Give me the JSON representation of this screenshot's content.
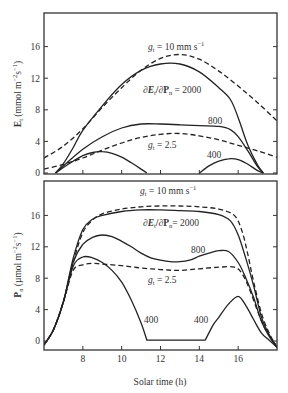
{
  "chart_data": [
    {
      "type": "line",
      "panel": "top",
      "ylabel": "E_t (mmol m⁻²s⁻¹)",
      "ylabel_main": "E",
      "ylabel_sub": "t",
      "ylabel_units": " (mmol m",
      "ylabel_exp1": "−2",
      "ylabel_mid": "s",
      "ylabel_exp2": "−1",
      "ylabel_end": ")",
      "xlim": [
        6,
        18
      ],
      "ylim": [
        0,
        20
      ],
      "yticks": [
        0,
        4,
        8,
        12,
        16
      ],
      "xticks": [
        8,
        10,
        12,
        14,
        16
      ],
      "annotations": {
        "g10": "g",
        "g10_sub": "t",
        "g10_rest": " = 10 mm s",
        "g10_exp": "−1",
        "ratio": "∂E",
        "ratio_sub1": "t",
        "ratio_mid": "/∂P",
        "ratio_sub2": "n",
        "ratio_rest": " = 2000",
        "l800": "800",
        "g25": "g",
        "g25_sub": "t",
        "g25_rest": " = 2.5",
        "l400": "400"
      },
      "series": [
        {
          "name": "g_t = 10 mm s-1",
          "style": "dashed",
          "x": [
            6.0,
            7,
            8,
            9,
            10,
            11,
            12,
            13,
            14,
            15,
            16,
            17,
            18
          ],
          "y": [
            1.9,
            3.4,
            5.6,
            8.3,
            10.8,
            13.0,
            14.5,
            15.0,
            14.4,
            12.9,
            11.0,
            8.9,
            6.6
          ]
        },
        {
          "name": "dEt/dPn = 2000",
          "style": "solid",
          "x": [
            6.6,
            7,
            7.5,
            8,
            9,
            10,
            11,
            12,
            13,
            14,
            15,
            15.6,
            16,
            16.5,
            17,
            17.3
          ],
          "y": [
            0,
            1.2,
            3.2,
            5.4,
            8.5,
            11.2,
            13.0,
            13.8,
            13.8,
            12.8,
            10.8,
            9.3,
            7.0,
            3.5,
            1.0,
            0
          ]
        },
        {
          "name": "800",
          "style": "solid",
          "x": [
            6.6,
            7,
            8,
            9,
            10,
            11,
            12,
            13,
            14,
            15,
            15.6,
            16,
            16.5,
            17,
            17.3
          ],
          "y": [
            0,
            0.9,
            3.0,
            4.6,
            5.7,
            6.2,
            6.2,
            6.1,
            6.0,
            5.9,
            5.5,
            4.6,
            2.8,
            0.8,
            0
          ]
        },
        {
          "name": "g_t = 2.5",
          "style": "dashed",
          "x": [
            6.0,
            7,
            8,
            9,
            10,
            11,
            12,
            13,
            14,
            15,
            16,
            17,
            18
          ],
          "y": [
            0.5,
            1.1,
            1.9,
            2.9,
            3.8,
            4.5,
            4.9,
            5.0,
            4.7,
            4.2,
            3.5,
            2.8,
            2.0
          ]
        },
        {
          "name": "400 (morning)",
          "style": "solid",
          "x": [
            6.6,
            7,
            7.5,
            8,
            8.5,
            9,
            9.5,
            10,
            10.5,
            11,
            11.3
          ],
          "y": [
            0,
            0.7,
            1.5,
            2.2,
            2.6,
            2.7,
            2.5,
            2.0,
            1.3,
            0.5,
            0
          ]
        },
        {
          "name": "400 (afternoon)",
          "style": "solid",
          "x": [
            14.0,
            14.5,
            15,
            15.5,
            16,
            16.5,
            17,
            17.3
          ],
          "y": [
            0,
            0.9,
            1.5,
            1.8,
            1.7,
            1.1,
            0.3,
            0
          ]
        }
      ]
    },
    {
      "type": "line",
      "panel": "bottom",
      "ylabel": "P_n (µmol m⁻²s⁻¹)",
      "ylabel_main": "P",
      "ylabel_sub": "n",
      "ylabel_units": " (µmol m",
      "ylabel_exp1": "−2",
      "ylabel_mid": "s",
      "ylabel_exp2": "−1",
      "ylabel_end": ")",
      "xlabel": "Solar time (h)",
      "xlim": [
        6,
        18
      ],
      "ylim": [
        -1.1,
        20.5
      ],
      "yticks": [
        0,
        4,
        8,
        12,
        16
      ],
      "xticks": [
        8,
        10,
        12,
        14,
        16
      ],
      "xticklabels": [
        "8",
        "10",
        "12",
        "14",
        "16"
      ],
      "annotations": {
        "g10": "g",
        "g10_sub": "t",
        "g10_rest": " = 10 mm s",
        "g10_exp": "−1",
        "ratio": "∂E",
        "ratio_sub1": "t",
        "ratio_mid": "/∂P",
        "ratio_sub2": "n",
        "ratio_rest": "= 2000",
        "l800": "800",
        "g25": "g",
        "g25_sub": "t",
        "g25_rest": " = 2.5",
        "l400a": "400",
        "l400b": "400"
      },
      "series": [
        {
          "name": "g_t = 10 mm s-1",
          "style": "dashed",
          "x": [
            6.0,
            6.5,
            7,
            7.5,
            8,
            8.5,
            9,
            10,
            11,
            12,
            13,
            14,
            15,
            15.8,
            16.2,
            16.5,
            16.8,
            17.2,
            17.6,
            18
          ],
          "y": [
            -0.5,
            1.5,
            5.0,
            10.0,
            13.8,
            15.4,
            16.2,
            16.8,
            17.1,
            17.2,
            17.2,
            17.1,
            16.8,
            16.0,
            14.0,
            11.0,
            7.5,
            3.5,
            1.0,
            -0.8
          ]
        },
        {
          "name": "dEt/dPn = 2000",
          "style": "solid",
          "x": [
            6.0,
            6.5,
            7,
            7.5,
            8,
            8.5,
            9,
            10,
            11,
            12,
            13,
            14,
            15,
            15.6,
            16,
            16.4,
            16.8,
            17.2,
            17.6,
            18
          ],
          "y": [
            -0.5,
            1.5,
            5.0,
            10.5,
            14.2,
            15.5,
            16.0,
            16.5,
            16.7,
            16.7,
            16.6,
            16.5,
            16.1,
            15.3,
            13.5,
            10.5,
            7.0,
            3.0,
            0.8,
            -0.8
          ]
        },
        {
          "name": "800",
          "style": "solid",
          "x": [
            6.0,
            6.5,
            7,
            7.5,
            8,
            8.5,
            9,
            9.5,
            10,
            10.5,
            11,
            11.5,
            12,
            12.5,
            13,
            13.5,
            14,
            14.5,
            15,
            15.5,
            16,
            16.4,
            16.8,
            17.2,
            17.6,
            18
          ],
          "y": [
            -0.5,
            1.5,
            5.0,
            10.0,
            12.3,
            13.2,
            13.5,
            13.3,
            12.7,
            12.0,
            11.2,
            10.6,
            10.3,
            10.1,
            10.1,
            10.3,
            10.8,
            11.2,
            11.5,
            11.4,
            10.0,
            8.0,
            5.5,
            2.5,
            0.6,
            -0.8
          ]
        },
        {
          "name": "g_t = 2.5",
          "style": "dashed",
          "x": [
            6.0,
            6.5,
            7,
            7.5,
            8,
            8.5,
            9,
            10,
            11,
            12,
            13,
            14,
            15,
            15.8,
            16.2,
            16.6,
            17,
            17.4,
            17.8,
            18
          ],
          "y": [
            -0.5,
            1.5,
            5.0,
            9.0,
            9.7,
            9.9,
            9.8,
            9.6,
            9.3,
            9.1,
            9.0,
            9.2,
            9.4,
            9.4,
            8.6,
            6.5,
            3.8,
            1.5,
            0.0,
            -0.8
          ]
        },
        {
          "name": "400",
          "style": "solid",
          "x": [
            6.0,
            6.5,
            7,
            7.5,
            8,
            8.5,
            9,
            9.5,
            10,
            10.5,
            11,
            11.3,
            14.3,
            14.7,
            15,
            15.5,
            16,
            16.4,
            16.8,
            17.2,
            17.6,
            18
          ],
          "y": [
            -0.5,
            1.5,
            5.0,
            9.5,
            10.7,
            10.6,
            10.0,
            9.0,
            7.5,
            5.2,
            2.3,
            0.1,
            0.1,
            2.0,
            3.0,
            4.7,
            5.7,
            4.5,
            2.7,
            1.0,
            0.1,
            -0.8
          ]
        }
      ]
    }
  ]
}
